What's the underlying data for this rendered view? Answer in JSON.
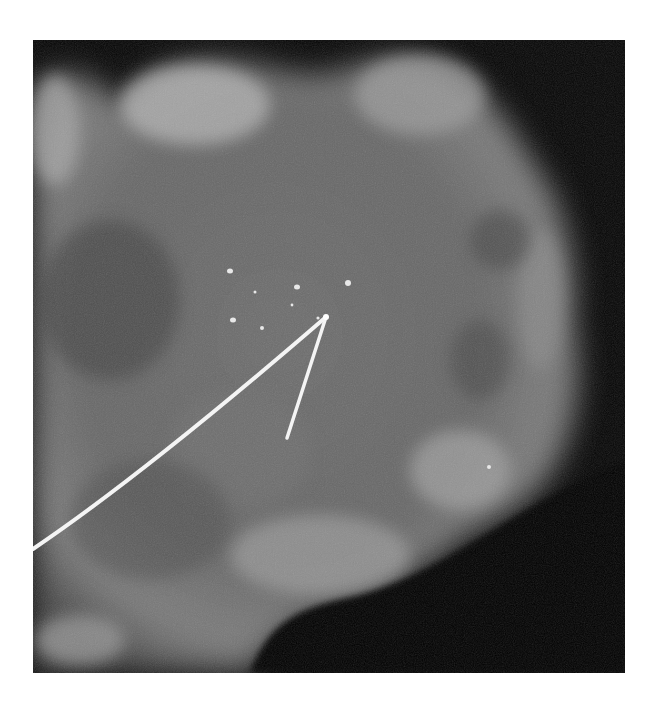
{
  "image": {
    "kind": "specimen radiograph",
    "background": "#ffffff",
    "frame": {
      "x": 33,
      "y": 40,
      "width": 592,
      "height": 633,
      "color": "#050505"
    },
    "tissue_color": "#7a7a7a",
    "wire_color": "#f4f4f4",
    "calcifications": [
      {
        "x": 230,
        "y": 271
      },
      {
        "x": 297,
        "y": 287
      },
      {
        "x": 348,
        "y": 283
      },
      {
        "x": 233,
        "y": 320
      },
      {
        "x": 262,
        "y": 328
      },
      {
        "x": 318,
        "y": 318
      },
      {
        "x": 292,
        "y": 305
      },
      {
        "x": 489,
        "y": 467
      }
    ]
  }
}
